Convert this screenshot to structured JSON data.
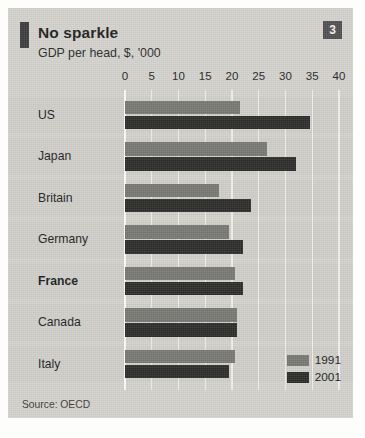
{
  "header": {
    "title": "No sparkle",
    "subtitle": "GDP per head, $, '000",
    "badge": "3"
  },
  "source": "Source: OECD",
  "colors": {
    "panel": "#d3d2cd",
    "band": "#cfcec9",
    "grid": "#f0efec",
    "series_1991": "#767672",
    "series_2001": "#2b2b29",
    "badge_bg": "#4f4f4f",
    "rule": "#3b3b3b"
  },
  "chart_data": {
    "type": "bar",
    "orientation": "horizontal",
    "title": "No sparkle",
    "subtitle": "GDP per head, $, '000",
    "xlabel": "",
    "ylabel": "",
    "xlim": [
      0,
      40
    ],
    "xticks": [
      0,
      5,
      10,
      15,
      20,
      25,
      30,
      35,
      40
    ],
    "grid": true,
    "legend_position": "bottom-right",
    "categories": [
      "US",
      "Japan",
      "Britain",
      "Germany",
      "France",
      "Canada",
      "Italy"
    ],
    "highlighted_category": "France",
    "series": [
      {
        "name": "1991",
        "color": "#767672",
        "values": [
          21.5,
          26.5,
          17.5,
          19.5,
          20.5,
          21.0,
          20.5
        ]
      },
      {
        "name": "2001",
        "color": "#2b2b29",
        "values": [
          34.5,
          32.0,
          23.5,
          22.0,
          22.0,
          21.0,
          19.5
        ]
      }
    ]
  }
}
